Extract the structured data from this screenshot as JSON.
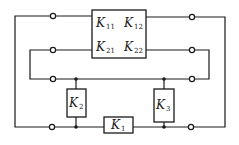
{
  "diagram": {
    "type": "circuit-network",
    "colors": {
      "stroke": "#1a1a1a",
      "background": "#ffffff"
    },
    "matrix_block": {
      "label_main": "K",
      "entries": [
        {
          "main": "K",
          "sub": "11"
        },
        {
          "main": "K",
          "sub": "12"
        },
        {
          "main": "K",
          "sub": "21"
        },
        {
          "main": "K",
          "sub": "22"
        }
      ]
    },
    "elements": [
      {
        "id": "K1",
        "main": "K",
        "sub": "1",
        "position": "bottom series"
      },
      {
        "id": "K2",
        "main": "K",
        "sub": "2",
        "position": "left shunt"
      },
      {
        "id": "K3",
        "main": "K",
        "sub": "3",
        "position": "right shunt"
      }
    ],
    "terminals": {
      "left": 4,
      "right": 4
    },
    "junction_nodes": 4
  }
}
